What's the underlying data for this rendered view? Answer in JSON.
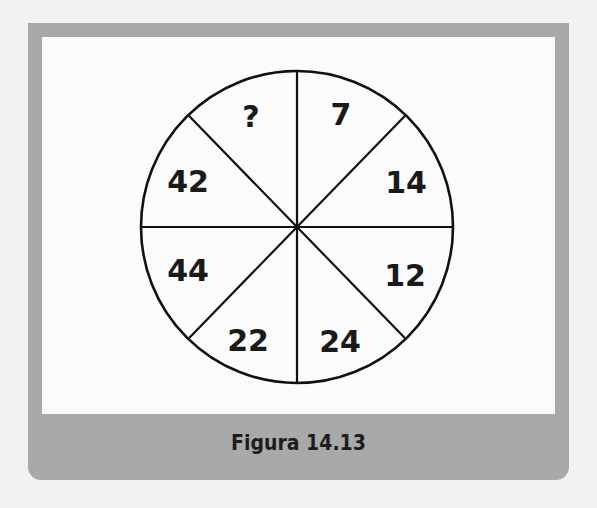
{
  "figure": {
    "caption": "Figura 14.13",
    "colors": {
      "frame": "#a9a9a9",
      "canvas": "#fbfbfb",
      "line": "#111111",
      "text": "#1a1a1a"
    },
    "wheel": {
      "segments": 8,
      "labels_clockwise_from_top_right": [
        "7",
        "14",
        "12",
        "24",
        "22",
        "44",
        "42",
        "?"
      ],
      "segment_7": "7",
      "segment_14": "14",
      "segment_12": "12",
      "segment_24": "24",
      "segment_22": "22",
      "segment_44": "44",
      "segment_42": "42",
      "segment_unknown": "?"
    }
  }
}
